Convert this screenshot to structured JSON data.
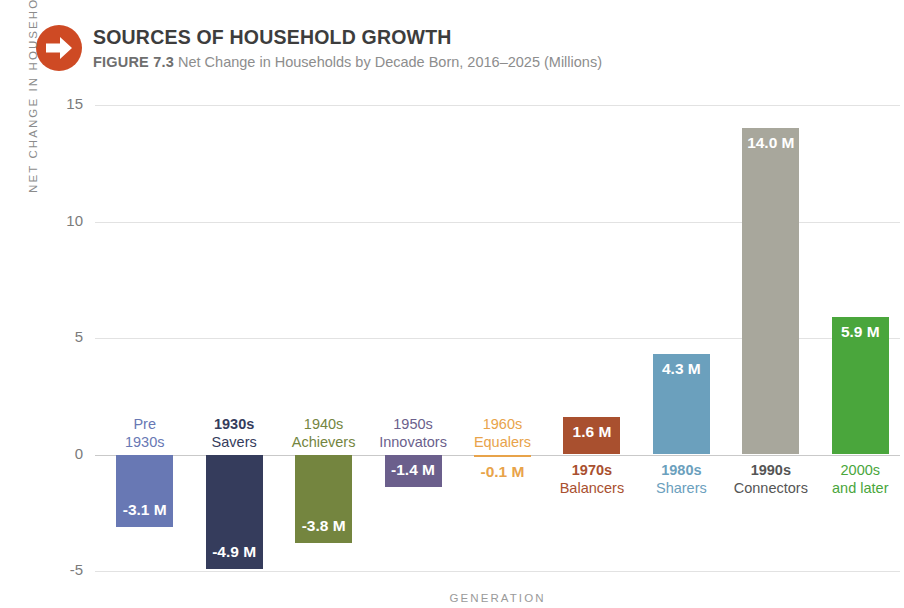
{
  "header": {
    "icon": "arrow-right-circle-icon",
    "title": "SOURCES OF HOUSEHOLD GROWTH",
    "figure_number": "FIGURE 7.3",
    "subtitle": "Net Change in Households by Decade Born, 2016–2025 (Millions)",
    "accent_color": "#ce4a24"
  },
  "chart_data": {
    "type": "bar",
    "title": "SOURCES OF HOUSEHOLD GROWTH",
    "subtitle": "Net Change in Households by Decade Born, 2016–2025 (Millions)",
    "xlabel": "GENERATION",
    "ylabel": "NET CHANGE IN HOUSEHOLDS (MILLIONS)",
    "ylim": [
      -5,
      15
    ],
    "yticks": [
      "-5",
      "0",
      "5",
      "10",
      "15"
    ],
    "grid": true,
    "legend": "none",
    "categories": [
      "Pre 1930s",
      "1930s Savers",
      "1940s Achievers",
      "1950s Innovators",
      "1960s Equalers",
      "1970s Balancers",
      "1980s Sharers",
      "1990s Connectors",
      "2000s and later"
    ],
    "values": [
      -3.1,
      -4.9,
      -3.8,
      -1.4,
      -0.1,
      1.6,
      4.3,
      14.0,
      5.9
    ],
    "value_labels": [
      "-3.1 M",
      "-4.9 M",
      "-3.8 M",
      "-1.4 M",
      "-0.1 M",
      "1.6 M",
      "4.3 M",
      "14.0 M",
      "5.9 M"
    ],
    "colors": [
      "#6878b4",
      "#353c5c",
      "#74853f",
      "#6b5f8c",
      "#e8a34a",
      "#a9502f",
      "#6ba0bd",
      "#a8a79c",
      "#4aa63c"
    ],
    "bars": [
      {
        "line1": "Pre",
        "line2": "1930s",
        "value_label": "-3.1 M",
        "value": -3.1,
        "color": "#6878b4",
        "label_color": "#6878b4",
        "value_color": "#ffffff",
        "label_bold": false
      },
      {
        "line1": "1930s",
        "line2": "Savers",
        "value_label": "-4.9 M",
        "value": -4.9,
        "color": "#353c5c",
        "label_color": "#353c5c",
        "value_color": "#ffffff",
        "label_bold": true
      },
      {
        "line1": "1940s",
        "line2": "Achievers",
        "value_label": "-3.8 M",
        "value": -3.8,
        "color": "#74853f",
        "label_color": "#74853f",
        "value_color": "#ffffff",
        "label_bold": false
      },
      {
        "line1": "1950s",
        "line2": "Innovators",
        "value_label": "-1.4 M",
        "value": -1.4,
        "color": "#6b5f8c",
        "label_color": "#6b5f8c",
        "value_color": "#ffffff",
        "label_bold": false
      },
      {
        "line1": "1960s",
        "line2": "Equalers",
        "value_label": "-0.1 M",
        "value": -0.1,
        "color": "#e8a34a",
        "label_color": "#e8a34a",
        "value_color": "#e8a34a",
        "label_bold": false
      },
      {
        "line1": "1970s",
        "line2": "Balancers",
        "value_label": "1.6 M",
        "value": 1.6,
        "color": "#a9502f",
        "label_color": "#a9502f",
        "value_color": "#ffffff",
        "label_bold": true
      },
      {
        "line1": "1980s",
        "line2": "Sharers",
        "value_label": "4.3 M",
        "value": 4.3,
        "color": "#6ba0bd",
        "label_color": "#6ba0bd",
        "value_color": "#ffffff",
        "label_bold": true
      },
      {
        "line1": "1990s",
        "line2": "Connectors",
        "value_label": "14.0 M",
        "value": 14.0,
        "color": "#a8a79c",
        "label_color": "#555555",
        "value_color": "#ffffff",
        "label_bold": true
      },
      {
        "line1": "2000s",
        "line2": "and later",
        "value_label": "5.9 M",
        "value": 5.9,
        "color": "#4aa63c",
        "label_color": "#4aa63c",
        "value_color": "#ffffff",
        "label_bold": false
      }
    ]
  }
}
